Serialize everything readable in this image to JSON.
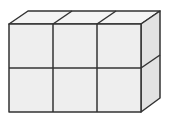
{
  "diagram": {
    "title": "",
    "cubes": {
      "columns": 3,
      "rows": 2,
      "depth": 1,
      "count": 6
    },
    "colors": {
      "front": "#eeeeee",
      "top": "#f4f4f4",
      "side": "#e2e2e2",
      "stroke": "#333333",
      "background": "#ffffff"
    }
  }
}
